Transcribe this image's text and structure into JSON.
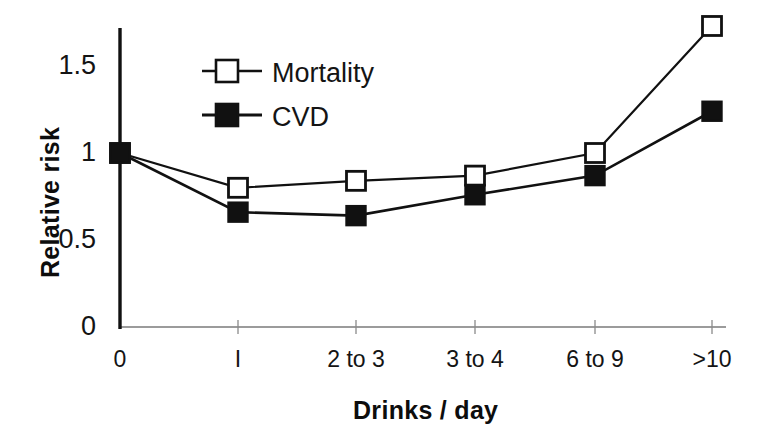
{
  "chart_data": {
    "type": "line",
    "title": "",
    "xlabel": "Drinks / day",
    "ylabel": "Relative risk",
    "categories": [
      "0",
      "I",
      "2 to 3",
      "3 to 4",
      "6 to 9",
      ">10"
    ],
    "yticks": [
      "0",
      "0.5",
      "1",
      "1.5"
    ],
    "ytick_values": [
      0,
      0.5,
      1,
      1.5
    ],
    "ylim": [
      0,
      1.8
    ],
    "grid": false,
    "legend_position": "upper-left-inside",
    "series": [
      {
        "name": "Mortality",
        "marker": "open-square",
        "values": [
          1.0,
          0.8,
          0.84,
          0.87,
          1.0,
          1.73
        ]
      },
      {
        "name": "CVD",
        "marker": "filled-square",
        "values": [
          1.0,
          0.66,
          0.64,
          0.76,
          0.87,
          1.24
        ]
      }
    ]
  },
  "axes": {
    "y_title": "Relative risk",
    "x_title": "Drinks / day"
  },
  "legend": {
    "items": [
      {
        "label": "Mortality",
        "marker": "open-square"
      },
      {
        "label": "CVD",
        "marker": "filled-square"
      }
    ]
  },
  "colors": {
    "line": "#111111",
    "marker_fill_open": "#ffffff",
    "marker_fill_solid": "#111111",
    "axis": "#6b6b6b",
    "yaxis": "#111111",
    "background": "#ffffff"
  }
}
